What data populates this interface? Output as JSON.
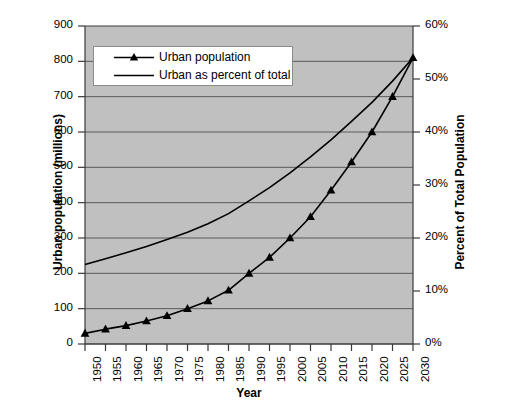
{
  "chart_data": {
    "type": "line",
    "title": "",
    "subtitle": "",
    "xlabel": "Year",
    "ylabel": "Urban population (millions)",
    "y2label": "Percent of Total Population",
    "x": [
      1950,
      1955,
      1960,
      1965,
      1970,
      1975,
      1980,
      1985,
      1990,
      1995,
      2000,
      2005,
      2010,
      2015,
      2020,
      2025,
      2030
    ],
    "categories": [
      "1950",
      "1955",
      "1960",
      "1965",
      "1970",
      "1975",
      "1980",
      "1985",
      "1990",
      "1995",
      "2000",
      "2005",
      "2010",
      "2015",
      "2020",
      "2025",
      "2030"
    ],
    "series": [
      {
        "name": "Urban population",
        "axis": "left",
        "marker": "triangle",
        "color": "#000000",
        "values": [
          30,
          42,
          52,
          65,
          80,
          100,
          122,
          152,
          200,
          245,
          300,
          360,
          435,
          515,
          600,
          700,
          810
        ]
      },
      {
        "name": "Urban as percent of total",
        "axis": "right",
        "marker": "none",
        "color": "#000000",
        "values": [
          15.0,
          16.1,
          17.2,
          18.4,
          19.7,
          21.1,
          22.7,
          24.6,
          27.0,
          29.5,
          32.3,
          35.3,
          38.5,
          42.0,
          45.6,
          49.6,
          54.0
        ]
      }
    ],
    "ylim": [
      0,
      900
    ],
    "ytick_labels": [
      "900",
      "800",
      "700",
      "600",
      "500",
      "400",
      "300",
      "200",
      "100",
      "0"
    ],
    "ytick_values": [
      900,
      800,
      700,
      600,
      500,
      400,
      300,
      200,
      100,
      0
    ],
    "y2lim": [
      0,
      60
    ],
    "y2tick_labels": [
      "60%",
      "50%",
      "40%",
      "30%",
      "20%",
      "10%",
      "0%"
    ],
    "y2tick_values": [
      60,
      50,
      40,
      30,
      20,
      10,
      0
    ],
    "grid": "horizontal",
    "plot_background": "#c0c0c0",
    "figure_background": "#ffffff",
    "legend_position": "top-left-inside",
    "legend_entries": [
      "Urban population",
      "Urban as percent of total"
    ]
  }
}
